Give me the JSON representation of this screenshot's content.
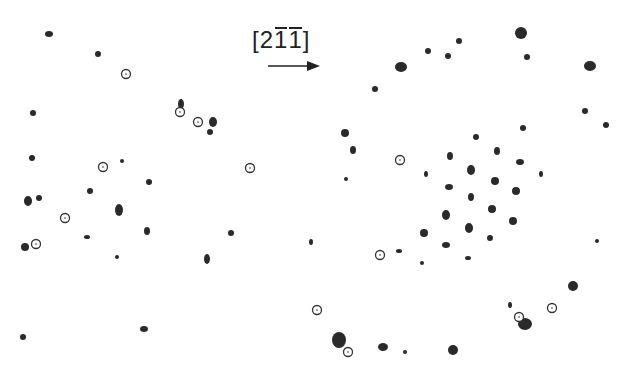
{
  "figure": {
    "direction_label": {
      "open": "[",
      "d1": "2",
      "d2": "1",
      "d3": "1",
      "close": "]",
      "overbars": [
        false,
        true,
        true
      ],
      "text": "[2 -1 -1]"
    },
    "arrow": {
      "x1": 268,
      "y1": 66,
      "x2": 320,
      "y2": 66,
      "color": "#222222"
    },
    "colors": {
      "spot": "#2a2a2a",
      "circle_stroke": "#333333",
      "background": "#ffffff"
    },
    "panels": [
      {
        "name": "left-pattern",
        "spots": [
          [
            49,
            34,
            4,
            3
          ],
          [
            98,
            54,
            3,
            3
          ],
          [
            33,
            113,
            3,
            3
          ],
          [
            181,
            104,
            3,
            5
          ],
          [
            213,
            122,
            4,
            5
          ],
          [
            210,
            132,
            3,
            3
          ],
          [
            32,
            158,
            3,
            3
          ],
          [
            122,
            161,
            2,
            2
          ],
          [
            90,
            191,
            3,
            3
          ],
          [
            149,
            182,
            3,
            3
          ],
          [
            28,
            201,
            4,
            5
          ],
          [
            39,
            198,
            3,
            3
          ],
          [
            119,
            210,
            4,
            6
          ],
          [
            87,
            237,
            3,
            2
          ],
          [
            147,
            231,
            3,
            4
          ],
          [
            231,
            233,
            3,
            3
          ],
          [
            25,
            247,
            4,
            4
          ],
          [
            117,
            257,
            2,
            2
          ],
          [
            207,
            259,
            3,
            5
          ],
          [
            23,
            337,
            3,
            3
          ],
          [
            144,
            329,
            4,
            3
          ]
        ],
        "circles": [
          [
            126,
            74
          ],
          [
            180,
            112
          ],
          [
            198,
            122
          ],
          [
            103,
            167
          ],
          [
            250,
            168
          ],
          [
            65,
            218
          ],
          [
            36,
            244
          ]
        ]
      },
      {
        "name": "right-pattern",
        "spots": [
          [
            521,
            33,
            6,
            6
          ],
          [
            527,
            57,
            3,
            3
          ],
          [
            401,
            67,
            6,
            5
          ],
          [
            428,
            51,
            3,
            3
          ],
          [
            448,
            56,
            3,
            3
          ],
          [
            459,
            41,
            3,
            3
          ],
          [
            375,
            89,
            3,
            3
          ],
          [
            590,
            66,
            6,
            5
          ],
          [
            585,
            111,
            3,
            3
          ],
          [
            606,
            125,
            3,
            3
          ],
          [
            345,
            133,
            4,
            4
          ],
          [
            353,
            150,
            3,
            4
          ],
          [
            346,
            179,
            2,
            2
          ],
          [
            523,
            128,
            3,
            3
          ],
          [
            476,
            137,
            3,
            3
          ],
          [
            450,
            156,
            3,
            4
          ],
          [
            497,
            151,
            3,
            4
          ],
          [
            520,
            162,
            4,
            3
          ],
          [
            426,
            174,
            2,
            3
          ],
          [
            471,
            170,
            4,
            5
          ],
          [
            541,
            174,
            2,
            3
          ],
          [
            449,
            187,
            4,
            3
          ],
          [
            495,
            181,
            4,
            4
          ],
          [
            516,
            191,
            4,
            4
          ],
          [
            471,
            197,
            3,
            4
          ],
          [
            446,
            215,
            4,
            5
          ],
          [
            492,
            209,
            4,
            4
          ],
          [
            424,
            233,
            4,
            4
          ],
          [
            469,
            228,
            4,
            5
          ],
          [
            513,
            221,
            4,
            4
          ],
          [
            446,
            245,
            4,
            3
          ],
          [
            490,
            238,
            3,
            3
          ],
          [
            468,
            258,
            3,
            2
          ],
          [
            422,
            263,
            2,
            2
          ],
          [
            399,
            251,
            3,
            2
          ],
          [
            311,
            242,
            2,
            3
          ],
          [
            597,
            241,
            2,
            2
          ],
          [
            573,
            286,
            5,
            5
          ],
          [
            510,
            305,
            2,
            3
          ],
          [
            525,
            324,
            7,
            6
          ],
          [
            339,
            340,
            7,
            8
          ],
          [
            383,
            347,
            5,
            4
          ],
          [
            405,
            352,
            2,
            2
          ],
          [
            453,
            350,
            5,
            5
          ]
        ],
        "circles": [
          [
            400,
            160
          ],
          [
            380,
            255
          ],
          [
            317,
            310
          ],
          [
            552,
            308
          ],
          [
            519,
            317
          ],
          [
            348,
            352
          ]
        ]
      }
    ]
  }
}
